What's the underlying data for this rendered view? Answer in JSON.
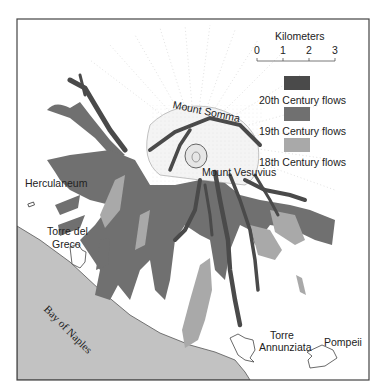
{
  "map": {
    "title": "Vesuvius lava flows",
    "scale": {
      "title": "Kilometers",
      "ticks": [
        "0",
        "1",
        "2",
        "3"
      ]
    },
    "legend": [
      {
        "label": "20th Century flows",
        "color": "#4a4a4a"
      },
      {
        "label": "19th Century flows",
        "color": "#707070"
      },
      {
        "label": "18th Century flows",
        "color": "#a9a9a9"
      }
    ],
    "places": {
      "mount_somma": "Mount Somma",
      "mount_vesuvius": "Mount Vesuvius",
      "herculaneum": "Herculaneum",
      "torre_del_greco_1": "Torre del",
      "torre_del_greco_2": "Greco",
      "bay": "Bay of Naples",
      "torre_annunziata_1": "Torre",
      "torre_annunziata_2": "Annunziata",
      "pompeii": "Pompeii"
    },
    "colors": {
      "sea": "#c2c2c2",
      "border": "#444444",
      "flow_20th": "#4a4a4a",
      "flow_19th": "#707070",
      "flow_18th": "#a9a9a9"
    }
  }
}
